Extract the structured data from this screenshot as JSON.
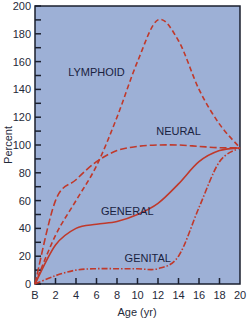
{
  "chart_data": {
    "type": "line",
    "title": "",
    "xlabel": "Age (yr)",
    "ylabel": "Percent",
    "x_tick_labels": [
      "B",
      "2",
      "4",
      "6",
      "8",
      "10",
      "12",
      "14",
      "16",
      "18",
      "20"
    ],
    "x": [
      0,
      2,
      4,
      6,
      8,
      10,
      12,
      14,
      16,
      18,
      20
    ],
    "y_tick_labels": [
      "0",
      "20",
      "40",
      "60",
      "80",
      "100",
      "120",
      "140",
      "160",
      "180",
      "200"
    ],
    "xlim": [
      0,
      20
    ],
    "ylim": [
      0,
      200
    ],
    "grid": false,
    "legend": "inline labels",
    "background_color": "#9db0d6",
    "line_color": "#c0392b",
    "series": [
      {
        "name": "LYMPHOID",
        "style": "dashed",
        "label_pos": [
          6,
          150
        ],
        "values": [
          0,
          35,
          60,
          85,
          120,
          160,
          190,
          175,
          140,
          115,
          98
        ]
      },
      {
        "name": "NEURAL",
        "style": "long-dashed",
        "label_pos": [
          14,
          107
        ],
        "values": [
          0,
          60,
          75,
          88,
          96,
          99,
          100,
          100,
          99,
          98,
          98
        ]
      },
      {
        "name": "GENERAL",
        "style": "solid",
        "label_pos": [
          9,
          50
        ],
        "values": [
          0,
          28,
          40,
          43,
          45,
          50,
          58,
          72,
          88,
          96,
          98
        ]
      },
      {
        "name": "GENITAL",
        "style": "dash-dot",
        "label_pos": [
          11,
          16
        ],
        "values": [
          0,
          6,
          10,
          11,
          11,
          11,
          11,
          20,
          55,
          88,
          98
        ]
      }
    ]
  },
  "labels": {
    "xlabel": "Age (yr)",
    "ylabel": "Percent",
    "lymphoid": "LYMPHOID",
    "neural": "NEURAL",
    "general": "GENERAL",
    "genital": "GENITAL"
  }
}
